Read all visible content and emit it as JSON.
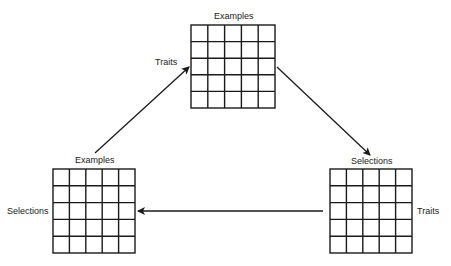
{
  "diagram": {
    "type": "cycle",
    "colors": {
      "line": "#1a1a1a",
      "background": "#ffffff",
      "text": "#222222"
    },
    "nodes": [
      {
        "id": "top",
        "grid": {
          "rows": 5,
          "cols": 5
        },
        "top_label": "Examples",
        "side_label": "Traits",
        "side": "left"
      },
      {
        "id": "bottom-right",
        "grid": {
          "rows": 5,
          "cols": 5
        },
        "top_label": "Selections",
        "side_label": "Traits",
        "side": "right"
      },
      {
        "id": "bottom-left",
        "grid": {
          "rows": 5,
          "cols": 5
        },
        "top_label": "Examples",
        "side_label": "Selections",
        "side": "left"
      }
    ],
    "edges": [
      {
        "from": "bottom-left",
        "to": "top"
      },
      {
        "from": "top",
        "to": "bottom-right"
      },
      {
        "from": "bottom-right",
        "to": "bottom-left"
      }
    ]
  }
}
